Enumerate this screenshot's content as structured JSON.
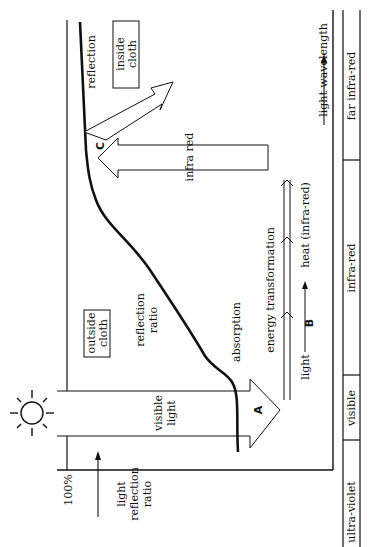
{
  "diagram": {
    "axis": {
      "y_top_label": "100%",
      "y_axis_label_lines": [
        "light",
        "reflection",
        "ratio"
      ],
      "x_axis_label": "light wavelength"
    },
    "spectrum_bands": [
      {
        "label": "ultra-violet"
      },
      {
        "label": "visible"
      },
      {
        "label": "infra-red"
      },
      {
        "label": "far infra-red"
      }
    ],
    "regions": {
      "outside_cloth_lines": [
        "outside",
        "cloth"
      ],
      "inside_cloth_lines": [
        "inside",
        "cloth"
      ]
    },
    "labels": {
      "visible_light_lines": [
        "visible",
        "light"
      ],
      "reflection_ratio_lines": [
        "reflection",
        "ratio"
      ],
      "absorption": "absorption",
      "energy_transformation": "energy transformation",
      "light": "light",
      "heat": "heat (infra-red)",
      "infra_red": "infra red",
      "reflection": "reflection"
    },
    "markers": {
      "A": "A",
      "B": "B",
      "C": "C"
    },
    "icons": {
      "sun": "sun-icon"
    },
    "colors": {
      "ink": "#111111",
      "background": "#ffffff"
    }
  }
}
